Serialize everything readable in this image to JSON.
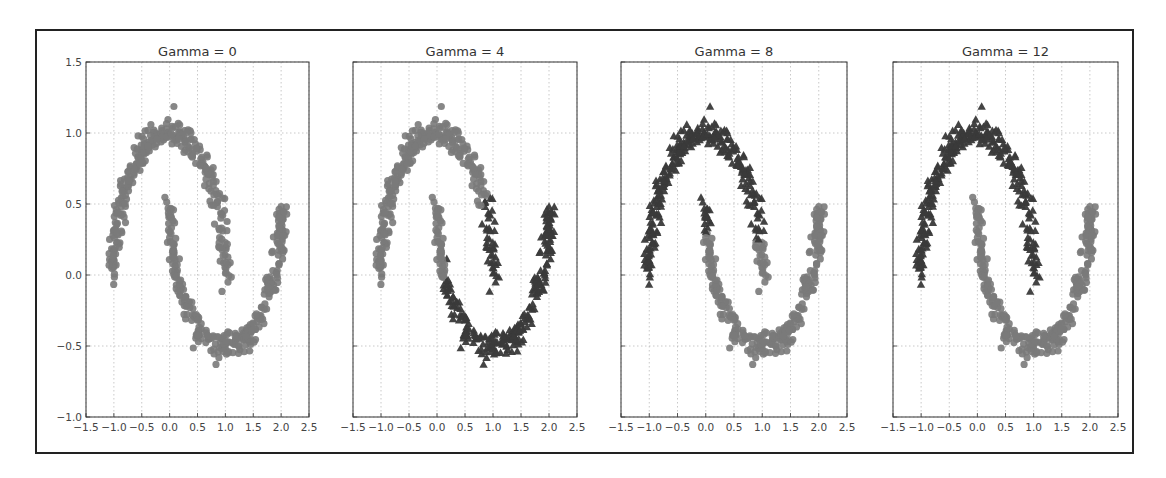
{
  "figure": {
    "frame_color": "#222222",
    "class0_color": "#7a7a7a",
    "class1_color": "#3a3a3a",
    "grid_color": "#bbbbbb"
  },
  "chart_data": [
    {
      "type": "scatter",
      "title": "Gamma = 0",
      "xlabel": "",
      "ylabel": "",
      "xlim": [
        -1.5,
        2.5
      ],
      "ylim": [
        -1.0,
        1.5
      ],
      "xticks": [
        "-1.5",
        "-1.0",
        "-0.5",
        "0.0",
        "0.5",
        "1.0",
        "1.5",
        "2.0",
        "2.5"
      ],
      "yticks": [
        "-1.0",
        "-0.5",
        "0.0",
        "0.5",
        "1.0",
        "1.5"
      ],
      "show_yticklabels": true,
      "grid": true,
      "series": [
        {
          "name": "upper moon",
          "marker": "circle",
          "shape": "upper moon, x from -1.0 to 1.0, peak y≈1.0",
          "label_split": "all class 0"
        },
        {
          "name": "lower moon",
          "marker": "circle",
          "shape": "lower moon, x from 0.0 to 2.0, trough y≈-0.5",
          "label_split": "all class 0"
        }
      ],
      "cluster_assignment": "single cluster (all light gray circles)"
    },
    {
      "type": "scatter",
      "title": "Gamma = 4",
      "xlim": [
        -1.5,
        2.5
      ],
      "ylim": [
        -1.0,
        1.5
      ],
      "xticks": [
        "-1.5",
        "-1.0",
        "-0.5",
        "0.0",
        "0.5",
        "1.0",
        "1.5",
        "2.0",
        "2.5"
      ],
      "show_yticklabels": false,
      "grid": true,
      "cluster_assignment": "light gray circles: x < ~0.8 region; dark triangles: right part (x > ~0.8 on upper moon tail and most of lower moon from x≈0.2)"
    },
    {
      "type": "scatter",
      "title": "Gamma = 8",
      "xlim": [
        -1.5,
        2.5
      ],
      "ylim": [
        -1.0,
        1.5
      ],
      "xticks": [
        "-1.5",
        "-1.0",
        "-0.5",
        "0.0",
        "0.5",
        "1.0",
        "1.5",
        "2.0",
        "2.5"
      ],
      "show_yticklabels": false,
      "grid": true,
      "cluster_assignment": "dark triangles: upper moon (y > ~0.3 on right tail) plus top of lower moon tip near x=0; light gray circles: lower moon and bottom of upper moon right tail"
    },
    {
      "type": "scatter",
      "title": "Gamma = 12",
      "xlim": [
        -1.5,
        2.5
      ],
      "ylim": [
        -1.0,
        1.5
      ],
      "xticks": [
        "-1.5",
        "-1.0",
        "-0.5",
        "0.0",
        "0.5",
        "1.0",
        "1.5",
        "2.0",
        "2.5"
      ],
      "show_yticklabels": false,
      "grid": true,
      "cluster_assignment": "dark triangles: entire upper moon; light gray circles: entire lower moon"
    }
  ]
}
